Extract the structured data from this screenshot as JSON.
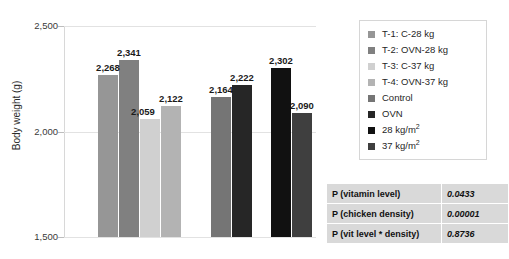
{
  "chart_data": {
    "type": "bar",
    "title": "",
    "xlabel": "",
    "ylabel": "Body weight (g)",
    "ylim": [
      1500,
      2500
    ],
    "yticks": [
      1500,
      2000,
      2500
    ],
    "ytick_labels": [
      "1,500",
      "2,000",
      "2,500"
    ],
    "grid": true,
    "legend_position": "right-top",
    "categories": [
      "T-1: C-28 kg",
      "T-2: OVN-28 kg",
      "T-3: C-37 kg",
      "T-4: OVN-37 kg",
      "Control",
      "OVN",
      "28 kg/m2",
      "37 kg/m2"
    ],
    "values": [
      2268,
      2341,
      2059,
      2122,
      2164,
      2222,
      2302,
      2090
    ],
    "data_labels": [
      "2,268",
      "2,341",
      "2,059",
      "2,122",
      "2,164",
      "2,222",
      "2,302",
      "2,090"
    ],
    "colors": [
      "#969696",
      "#808080",
      "#d0d0d0",
      "#b3b3b3",
      "#757575",
      "#262626",
      "#111111",
      "#3f3f3f"
    ],
    "groups": [
      {
        "name": "Vitamin level x density treatments",
        "bar_indices": [
          0,
          1,
          2,
          3
        ]
      },
      {
        "name": "Vitamin level main effect",
        "bar_indices": [
          4,
          5
        ]
      },
      {
        "name": "Chicken density main effect",
        "bar_indices": [
          6,
          7
        ]
      }
    ]
  },
  "legend": {
    "items": [
      {
        "label": "T-1: C-28 kg",
        "color": "#969696"
      },
      {
        "label": "T-2: OVN-28 kg",
        "color": "#808080"
      },
      {
        "label": "T-3: C-37 kg",
        "color": "#d0d0d0"
      },
      {
        "label": "T-4: OVN-37 kg",
        "color": "#b3b3b3"
      },
      {
        "label": "Control",
        "color": "#757575"
      },
      {
        "label": "OVN",
        "color": "#262626"
      },
      {
        "label": "28 kg/m",
        "sup": "2",
        "color": "#111111"
      },
      {
        "label": "37 kg/m",
        "sup": "2",
        "color": "#3f3f3f"
      }
    ]
  },
  "pvalue_table": {
    "rows": [
      {
        "name": "P (vitamin level)",
        "value": "0.0433"
      },
      {
        "name": "P (chicken density)",
        "value": "0.00001"
      },
      {
        "name": "P (vit level * density)",
        "value": "0.8736"
      }
    ]
  }
}
